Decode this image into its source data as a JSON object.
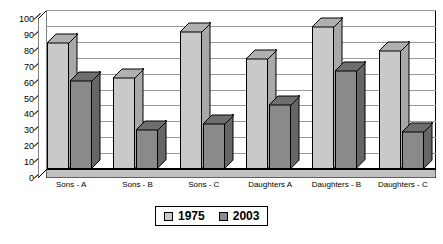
{
  "chart_data": {
    "type": "bar",
    "title": "",
    "subtitle": "",
    "xlabel": "",
    "ylabel": "",
    "ylim": [
      0,
      100
    ],
    "ytick_step": 10,
    "yticks": [
      0,
      10,
      20,
      30,
      40,
      50,
      60,
      70,
      80,
      90,
      100
    ],
    "grid": true,
    "legend_position": "bottom-center",
    "style": "3d-column",
    "categories": [
      "Sons - A",
      "Sons - B",
      "Sons - C",
      "Daughters A",
      "Daughters - B",
      "Daughters - C"
    ],
    "series": [
      {
        "name": "1975",
        "color": "#c9c9c9",
        "values": [
          80,
          58,
          87,
          70,
          90,
          75
        ]
      },
      {
        "name": "2003",
        "color": "#8a8a8a",
        "values": [
          56,
          25,
          29,
          41,
          62,
          24
        ]
      }
    ]
  },
  "legend": {
    "entries": [
      {
        "label": "1975",
        "swatch": "light"
      },
      {
        "label": "2003",
        "swatch": "dark"
      }
    ]
  },
  "colors": {
    "series_1975": "#c9c9c9",
    "series_2003": "#8a8a8a",
    "gridline": "#9a9a9a",
    "axis": "#000000",
    "background": "#ffffff"
  }
}
